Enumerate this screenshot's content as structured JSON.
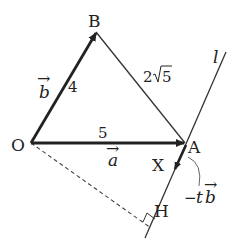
{
  "diagram": {
    "type": "vector-geometry",
    "points": {
      "O": {
        "label": "O"
      },
      "A": {
        "label": "A"
      },
      "B": {
        "label": "B"
      },
      "X": {
        "label": "X"
      },
      "H": {
        "label": "H"
      }
    },
    "line_label": "l",
    "edge_lengths": {
      "OA": "5",
      "OB": "4",
      "AB_coef": "2",
      "AB_root": "5"
    },
    "vectors": {
      "a": {
        "letter": "a",
        "arrow": "→"
      },
      "b": {
        "letter": "b",
        "arrow": "→"
      },
      "neg_tb": {
        "prefix": "−",
        "t": "t",
        "letter": "b",
        "arrow": "→"
      }
    },
    "colors": {
      "stroke": "#222222",
      "thin_stroke": "#333333",
      "dashed": "#444444"
    }
  }
}
